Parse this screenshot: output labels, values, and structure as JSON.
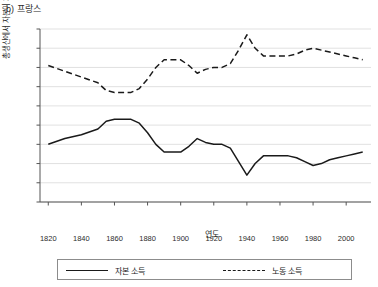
{
  "panel": {
    "label": "b) 프랑스"
  },
  "axis": {
    "x_title": "연도",
    "y_title": "총생산에서 자본이 차지하는 비중(%)",
    "y_ticks": [
      0,
      10,
      20,
      30,
      40,
      50,
      60,
      70,
      80,
      90
    ],
    "x_ticks": [
      1820,
      1840,
      1860,
      1880,
      1900,
      1920,
      1940,
      1960,
      1980,
      2000
    ]
  },
  "legend": {
    "capital_label": "자본 소득",
    "labor_label": "노동 소득"
  },
  "chart_data": {
    "type": "line",
    "title": "b) 프랑스",
    "xlabel": "연도",
    "ylabel": "총생산에서 자본이 차지하는 비중(%)",
    "xlim": [
      1815,
      2015
    ],
    "ylim": [
      0,
      90
    ],
    "grid": true,
    "legend_position": "bottom",
    "x_ticks": [
      1820,
      1840,
      1860,
      1880,
      1900,
      1920,
      1940,
      1960,
      1980,
      2000
    ],
    "y_ticks": [
      0,
      10,
      20,
      30,
      40,
      50,
      60,
      70,
      80,
      90
    ],
    "series": [
      {
        "name": "자본 소득",
        "style": "solid",
        "color": "#1a1a1a",
        "x": [
          1820,
          1830,
          1840,
          1850,
          1855,
          1860,
          1865,
          1870,
          1875,
          1880,
          1885,
          1890,
          1895,
          1900,
          1905,
          1910,
          1915,
          1920,
          1925,
          1930,
          1935,
          1940,
          1945,
          1950,
          1955,
          1960,
          1965,
          1970,
          1975,
          1980,
          1985,
          1990,
          1995,
          2000,
          2005,
          2010
        ],
        "y": [
          30,
          33,
          35,
          38,
          42,
          43,
          43,
          43,
          41,
          36,
          30,
          26,
          26,
          26,
          29,
          33,
          31,
          30,
          30,
          28,
          21,
          14,
          20,
          24,
          24,
          24,
          24,
          23,
          21,
          19,
          20,
          22,
          23,
          24,
          25,
          26
        ]
      },
      {
        "name": "노동 소득",
        "style": "dashed",
        "color": "#1a1a1a",
        "x": [
          1820,
          1830,
          1840,
          1850,
          1855,
          1860,
          1865,
          1870,
          1875,
          1880,
          1885,
          1890,
          1895,
          1900,
          1905,
          1910,
          1915,
          1920,
          1925,
          1930,
          1935,
          1940,
          1945,
          1950,
          1955,
          1960,
          1965,
          1970,
          1975,
          1980,
          1985,
          1990,
          1995,
          2000,
          2005,
          2010
        ],
        "y": [
          71,
          68,
          65,
          62,
          58,
          57,
          57,
          57,
          59,
          64,
          70,
          74,
          74,
          74,
          71,
          67,
          69,
          70,
          70,
          72,
          79,
          87,
          80,
          76,
          76,
          76,
          76,
          77,
          79,
          80,
          79,
          78,
          77,
          76,
          75,
          74
        ]
      }
    ]
  }
}
